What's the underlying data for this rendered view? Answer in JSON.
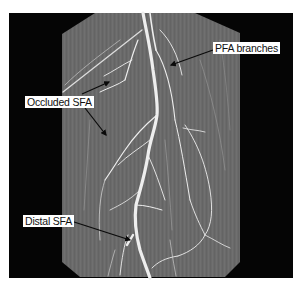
{
  "figure": {
    "type": "CT angiogram (maximum intensity projection) of the thigh",
    "colors": {
      "page_background": "#ffffff",
      "frame_background": "#050505",
      "tissue": "#6b6b6b",
      "vessel": "#f2f2f2",
      "arrow": "#0a0a0a",
      "label_background": "#ffffff",
      "label_text": "#111111"
    }
  },
  "annotations": [
    {
      "id": "pfa",
      "label": "PFA branches",
      "arrows": 1
    },
    {
      "id": "occluded",
      "label": "Occluded SFA",
      "arrows": 2
    },
    {
      "id": "distal",
      "label": "Distal SFA",
      "arrows": 1
    }
  ]
}
